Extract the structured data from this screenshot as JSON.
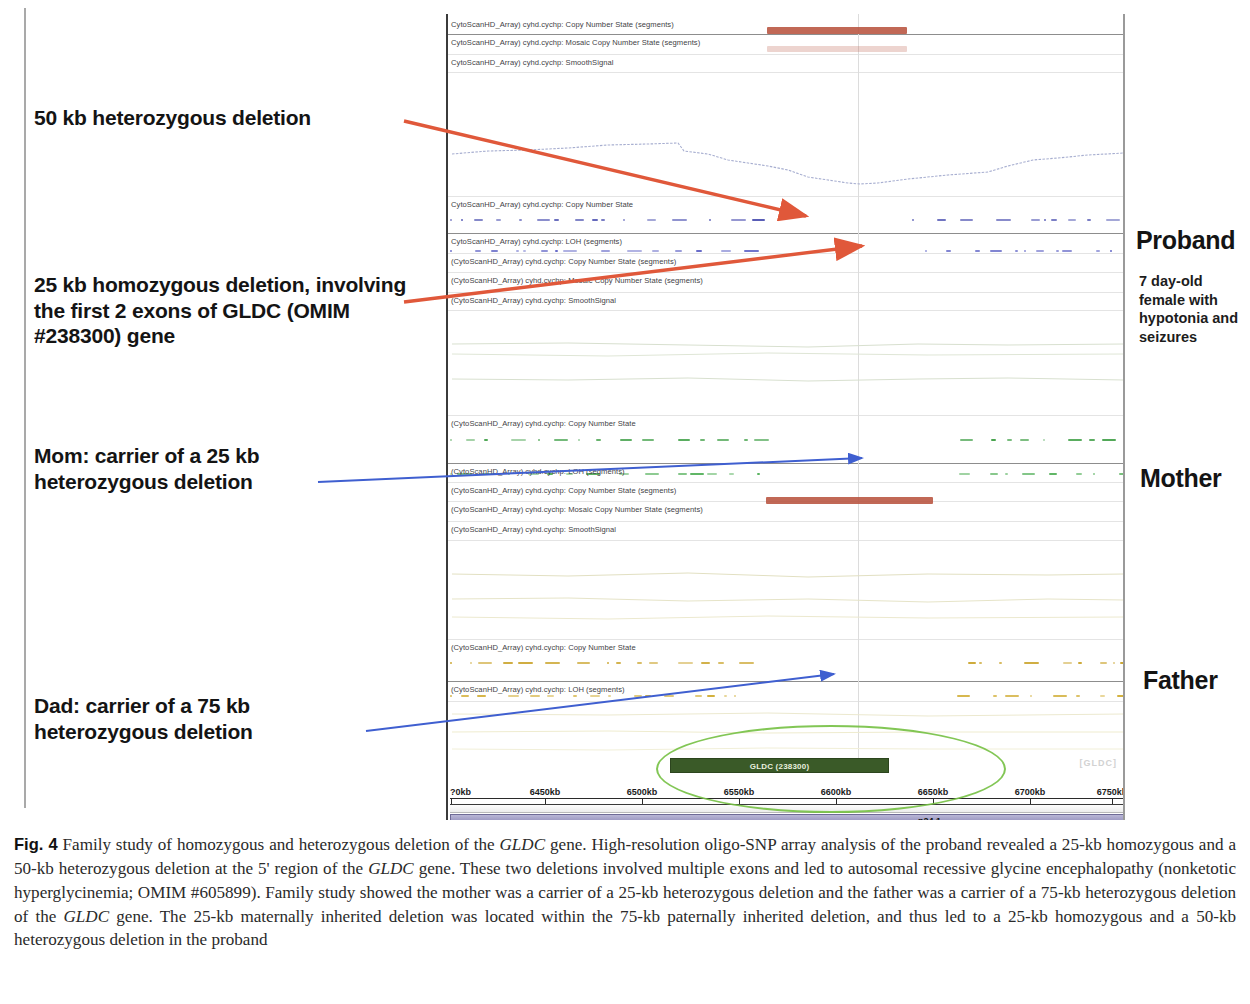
{
  "annotations": {
    "deletion_50kb": "50 kb heterozygous deletion",
    "deletion_25kb": "25 kb homozygous deletion, involving the first 2 exons of GLDC (OMIM #238300) gene",
    "mom": "Mom: carrier of a 25 kb heterozygous deletion",
    "dad": "Dad: carrier of a 75 kb heterozygous deletion"
  },
  "side_labels": {
    "proband": "Proband",
    "proband_desc": "7 day-old female with hypotonia and seizures",
    "mother": "Mother",
    "father": "Father"
  },
  "browser": {
    "tracks": [
      {
        "label": "CytoScanHD_Array) cyhd.cychp: Copy Number State (segments)",
        "top": 6
      },
      {
        "label": "CytoScanHD_Array) cyhd.cychp: Mosaic Copy Number State (segments)",
        "top": 24
      },
      {
        "label": "CytoScanHD_Array) cyhd.cychp: SmoothSignal",
        "top": 44
      },
      {
        "label": "CytoScanHD_Array) cyhd.cychp: Copy Number State",
        "top": 186
      },
      {
        "label": "CytoScanHD_Array) cyhd.cychp: LOH (segments)",
        "top": 223
      },
      {
        "label": "(CytoScanHD_Array) cyhd.cychp: Copy Number State (segments)",
        "top": 243
      },
      {
        "label": "(CytoScanHD_Array) cyhd.cychp: Mosaic Copy Number State (segments)",
        "top": 262
      },
      {
        "label": "(CytoScanHD_Array) cyhd.cychp: SmoothSignal",
        "top": 282
      },
      {
        "label": "(CytoScanHD_Array) cyhd.cychp: Copy Number State",
        "top": 405
      },
      {
        "label": "(CytoScanHD_Array) cyhd.cychp: LOH (segments)",
        "top": 453
      },
      {
        "label": "(CytoScanHD_Array) cyhd.cychp: Copy Number State (segments)",
        "top": 472
      },
      {
        "label": "(CytoScanHD_Array) cyhd.cychp: Mosaic Copy Number State (segments)",
        "top": 491
      },
      {
        "label": "(CytoScanHD_Array) cyhd.cychp: SmoothSignal",
        "top": 511
      },
      {
        "label": "(CytoScanHD_Array) cyhd.cychp: Copy Number State",
        "top": 629
      },
      {
        "label": "(CytoScanHD_Array) cyhd.cychp: LOH (segments)",
        "top": 671
      }
    ],
    "gene_bar_label": "GLDC (238300)",
    "ideogram_band": "p24.1",
    "faint_right_text": "[GLDC]"
  },
  "chart_data": {
    "type": "line",
    "xlabel": "Genomic position (kb)",
    "ylabel": "",
    "grid": false,
    "legend_position": "right",
    "x_axis": {
      "tick_labels": [
        "?0kb",
        "6450kb",
        "6500kb",
        "6550kb",
        "6600kb",
        "6650kb",
        "6700kb",
        "6750kb"
      ],
      "tick_positions_px": [
        3,
        97,
        194,
        291,
        388,
        485,
        582,
        664
      ],
      "range_kb": [
        6400,
        6770
      ]
    },
    "annotations_on_chart": [
      {
        "text": "GLDC (238300)",
        "type": "gene-bar",
        "start_kb": 6530,
        "end_kb": 6640
      },
      {
        "text": "p24.1",
        "type": "cytoband"
      }
    ],
    "series": [
      {
        "name": "Proband deletion segment (50 kb heterozygous)",
        "type": "segment",
        "color": "#b8533f",
        "start_kb": 6560,
        "end_kb": 6635,
        "row": "proband-copy-number-state-segments"
      },
      {
        "name": "Proband mosaic copy number segment",
        "type": "segment",
        "color": "#b8533f",
        "start_kb": 6560,
        "end_kb": 6635,
        "row": "proband-mosaic-copy-number-state-segments"
      },
      {
        "name": "Mother deletion segment (25 kb heterozygous)",
        "type": "segment",
        "color": "#b8533f",
        "start_kb": 6560,
        "end_kb": 6650,
        "row": "mother-copy-number-state-segments"
      },
      {
        "name": "Proband SmoothSignal",
        "type": "line",
        "color": "#9aa3c8",
        "x_kb": [
          6400,
          6440,
          6480,
          6510,
          6540,
          6560,
          6580,
          6600,
          6620,
          6650,
          6690,
          6720,
          6760
        ],
        "values": [
          1.02,
          1.0,
          0.99,
          0.97,
          0.93,
          0.88,
          0.82,
          0.8,
          0.84,
          0.88,
          0.92,
          0.98,
          1.0
        ]
      },
      {
        "name": "Proband Copy Number State probes",
        "type": "scatter",
        "color": "#4a4fb0",
        "level": 2
      },
      {
        "name": "Mother Copy Number State probes",
        "type": "scatter",
        "color": "#3f9f46",
        "level": 2
      },
      {
        "name": "Father Copy Number State probes",
        "type": "scatter",
        "color": "#c9a227",
        "level": 2
      }
    ]
  },
  "caption": {
    "label": "Fig. 4",
    "text_1": " Family study of homozygous and heterozygous deletion of the ",
    "gene_1": "GLDC",
    "text_2": " gene. High-resolution oligo-SNP array analysis of the proband revealed a 25-kb homozygous and a 50-kb heterozygous deletion at the 5' region of the ",
    "gene_2": "GLDC",
    "text_3": " gene. These two deletions involved multiple exons and led to autosomal recessive glycine encephalopathy (nonketotic hyperglycinemia; OMIM #605899). Family study showed the mother was a carrier of a 25-kb heterozygous deletion and the father was a carrier of a 75-kb heterozygous deletion of the ",
    "gene_3": "GLDC",
    "text_4": " gene. The 25-kb maternally inherited deletion was located within the 75-kb paternally inherited deletion, and thus led to a 25-kb homozygous and a 50-kb heterozygous deletion in the proband"
  }
}
